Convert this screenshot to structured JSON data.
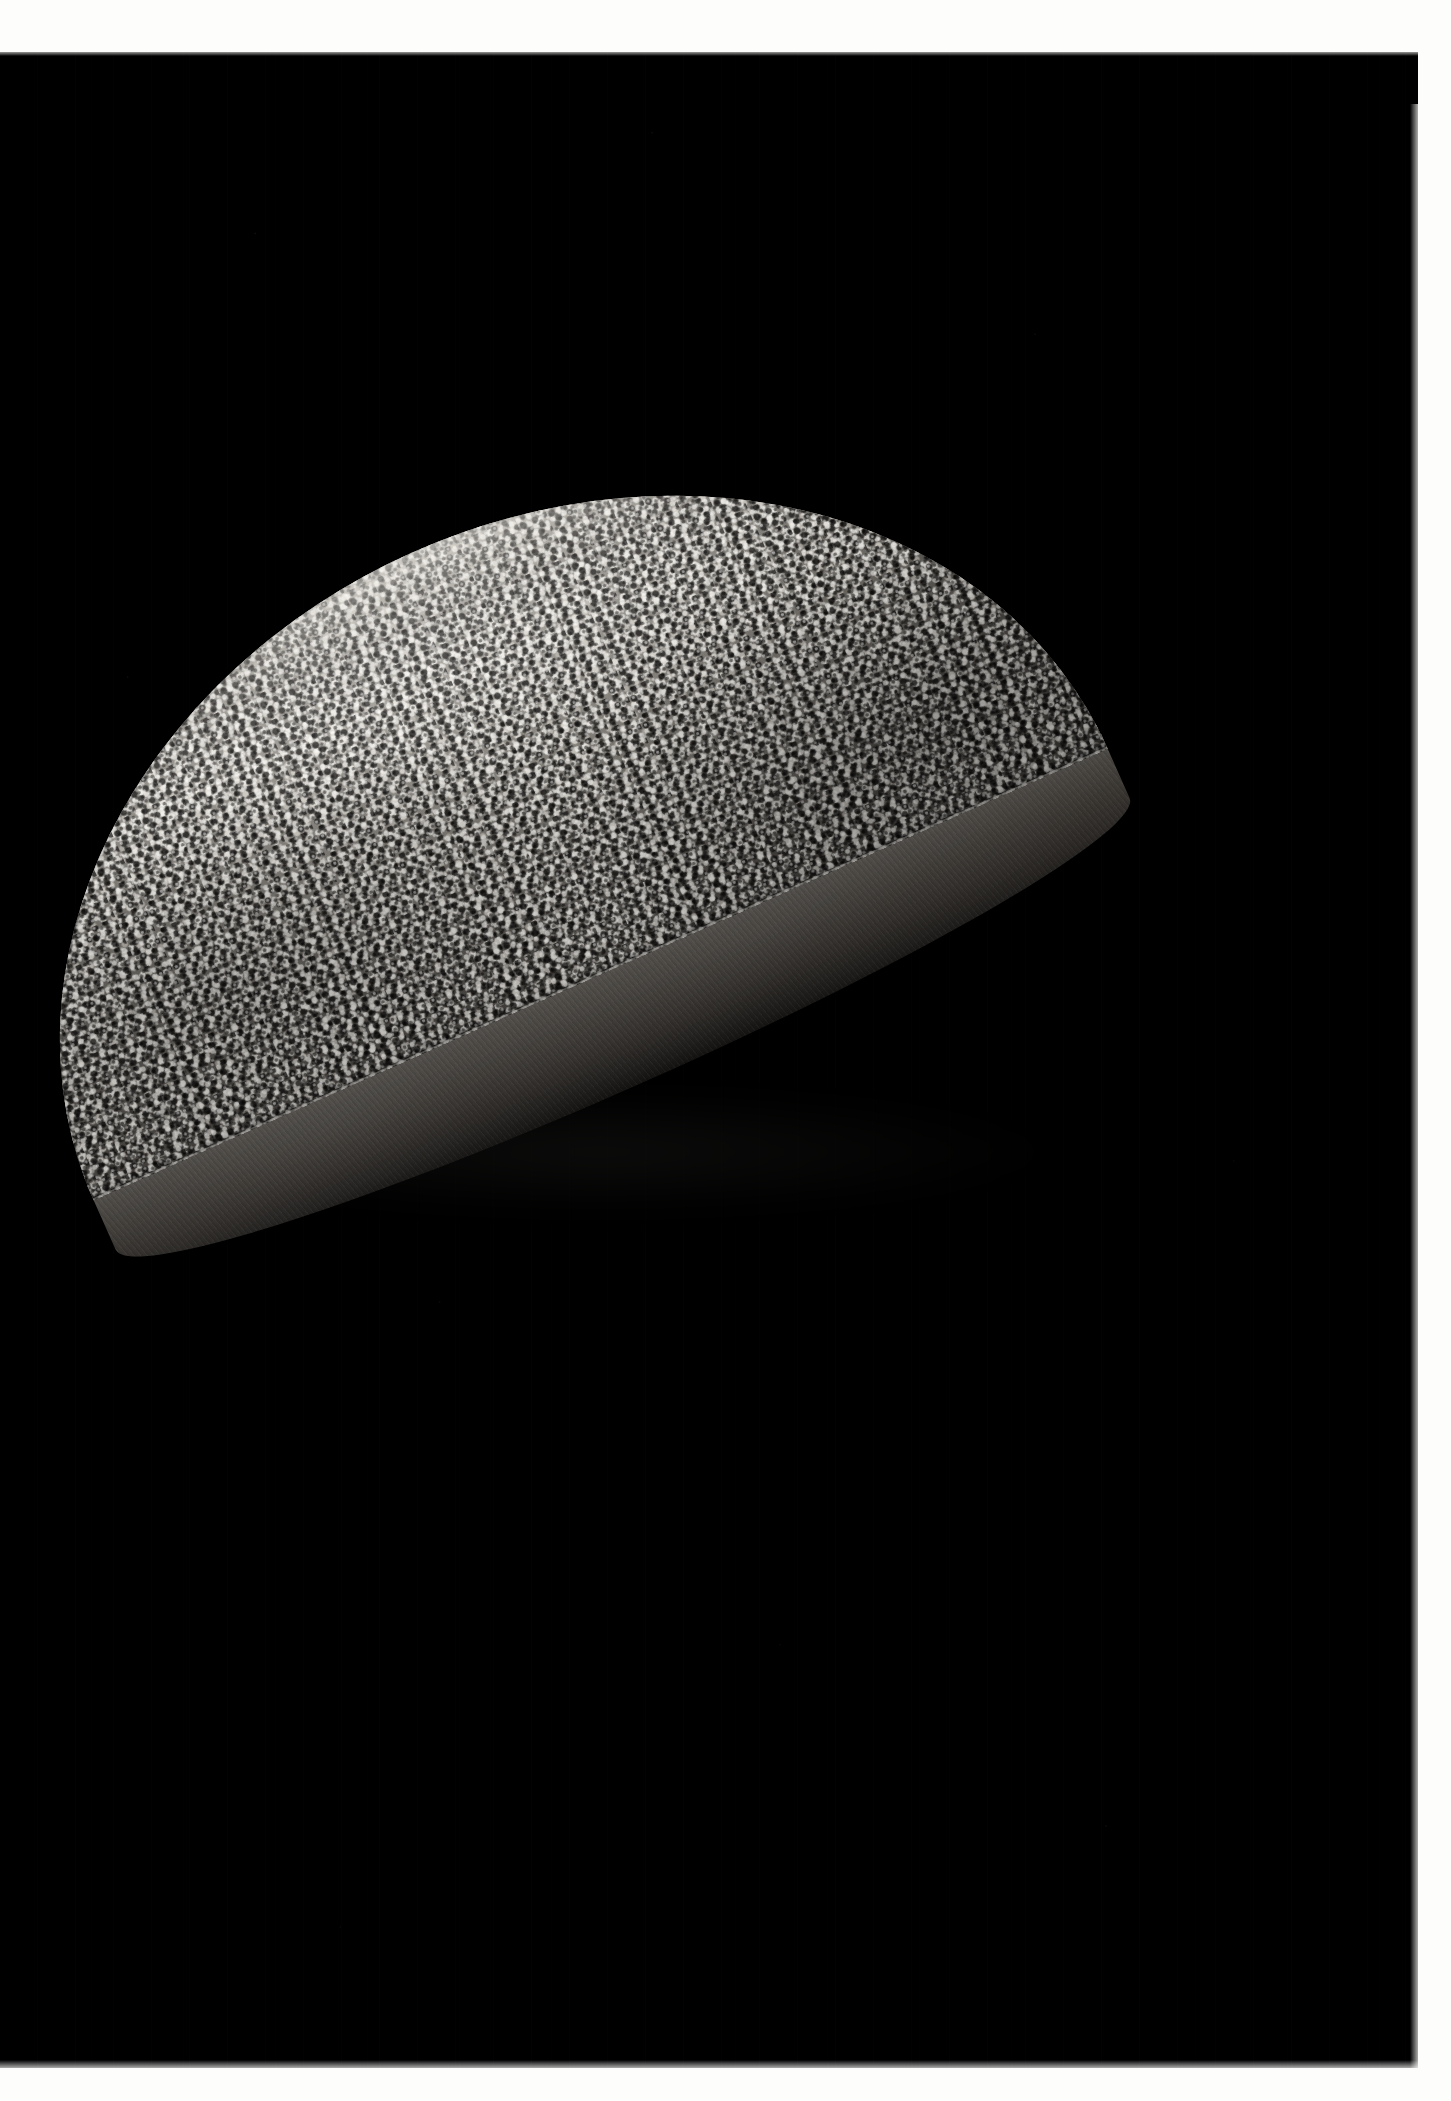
{
  "image": {
    "kind": "photograph",
    "orientation": "portrait",
    "width_px": 1451,
    "height_px": 2101,
    "background_color": "#000000",
    "paper_border_color": "#fdfdfb",
    "description": "Studio photograph of a half-disc shaped object on a pure black background"
  },
  "borders": {
    "top_height_px": 52,
    "bottom_start_y_px": 2068,
    "right_start_x_px": 1418,
    "left_width_px": 0
  },
  "subject": {
    "name": "half-disc-object",
    "shape": "semicircle",
    "rotation_deg": -24,
    "bounds": {
      "left_px": 118,
      "top_px": 497,
      "width_px": 1110,
      "height_px": 640
    },
    "parts": {
      "top_surface": {
        "name": "granular-top-surface",
        "texture": "dense coarse crumb / flake granules",
        "tone_range": [
          "#141312",
          "#f6f4ee"
        ],
        "mean_tone": "#6d6a64"
      },
      "side_face": {
        "name": "cut-side-face",
        "texture": "smooth matte slab edge",
        "tone_range": [
          "#141312",
          "#55524e"
        ],
        "mean_tone": "#3a3733"
      },
      "rim_highlight": {
        "name": "far-rim-specular-highlight",
        "tone": "#f6f4ee"
      }
    }
  },
  "lighting": {
    "key_direction": "upper-left",
    "falloff": "strong, background falls to pure black",
    "shadow_tone": "#000000"
  },
  "palette": {
    "black": "#000000",
    "paper_white": "#fdfdfb",
    "crumb_light": "#f2efe8",
    "crumb_mid": "#9a968f",
    "crumb_dark": "#1a1918",
    "slab_gray": "#3a3733"
  }
}
